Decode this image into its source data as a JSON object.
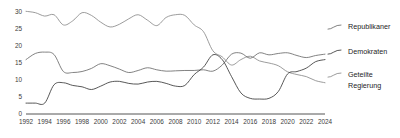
{
  "chart_data": {
    "type": "line",
    "title": "",
    "subtitle": "",
    "xlabel": "",
    "ylabel": "",
    "xlim": [
      1992,
      2024
    ],
    "ylim": [
      0,
      31
    ],
    "yticks": [
      0,
      5,
      10,
      15,
      20,
      25,
      30
    ],
    "ytick_labels": [
      "0",
      "5",
      "10",
      "15",
      "20",
      "25",
      "30"
    ],
    "xticks": [
      1992,
      1994,
      1996,
      1998,
      2000,
      2002,
      2004,
      2006,
      2008,
      2010,
      2012,
      2014,
      2016,
      2018,
      2020,
      2022,
      2024
    ],
    "xtick_labels": [
      "1992",
      "1994",
      "1996",
      "1998",
      "2000",
      "2002",
      "2004",
      "2006",
      "2008",
      "2010",
      "2012",
      "2014",
      "2016",
      "2018",
      "2020",
      "2022",
      "2024"
    ],
    "grid": false,
    "legend_position": "right",
    "x": [
      1992,
      1993,
      1994,
      1995,
      1996,
      1997,
      1998,
      1999,
      2000,
      2001,
      2002,
      2003,
      2004,
      2005,
      2006,
      2007,
      2008,
      2009,
      2010,
      2011,
      2012,
      2013,
      2014,
      2015,
      2016,
      2017,
      2018,
      2019,
      2020,
      2021,
      2022,
      2023,
      2024
    ],
    "series": [
      {
        "name": "Republikaner",
        "color": "#6b6b6b",
        "values": [
          16.0,
          17.8,
          18.2,
          17.5,
          12.5,
          12.2,
          12.5,
          13.4,
          14.8,
          14.2,
          13.2,
          12.2,
          12.8,
          13.6,
          13.0,
          12.6,
          12.7,
          12.8,
          12.8,
          13.0,
          12.6,
          14.4,
          17.6,
          17.9,
          16.4,
          18.0,
          17.4,
          17.8,
          18.0,
          17.2,
          16.6,
          17.2,
          17.6
        ]
      },
      {
        "name": "Demokraten",
        "color": "#3a3a3a",
        "values": [
          3.2,
          3.2,
          3.2,
          8.6,
          9.2,
          8.4,
          8.0,
          7.2,
          8.2,
          9.4,
          9.6,
          9.0,
          8.8,
          9.4,
          9.6,
          9.0,
          8.2,
          8.4,
          11.6,
          13.8,
          17.4,
          16.0,
          11.0,
          6.2,
          4.6,
          4.4,
          4.6,
          6.6,
          11.8,
          12.5,
          13.5,
          15.4,
          16.0
        ]
      },
      {
        "name": "Geteilte Regierung",
        "color": "#8a8a8a",
        "values": [
          30.2,
          29.8,
          28.8,
          29.2,
          26.2,
          27.4,
          29.8,
          29.0,
          27.0,
          25.6,
          26.4,
          28.0,
          29.2,
          27.6,
          26.0,
          28.4,
          29.2,
          29.0,
          26.2,
          24.2,
          18.6,
          16.8,
          14.4,
          16.0,
          17.0,
          15.6,
          15.0,
          14.2,
          12.4,
          11.6,
          11.0,
          9.8,
          9.2
        ]
      }
    ]
  },
  "legend": {
    "items": [
      {
        "label": "Republikaner",
        "label_line2": ""
      },
      {
        "label": "Demokraten",
        "label_line2": ""
      },
      {
        "label": "Geteilte",
        "label_line2": "Regierung"
      }
    ]
  }
}
